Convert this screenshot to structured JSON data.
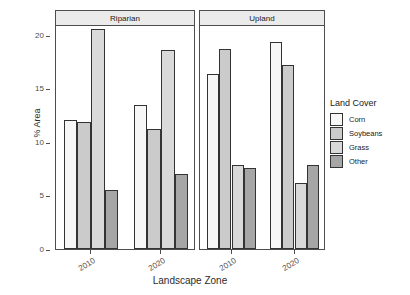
{
  "chart_data": {
    "type": "bar",
    "title": "",
    "xlabel": "Landscape Zone",
    "ylabel": "% Area",
    "ylim": [
      0,
      21
    ],
    "yticks": [
      0,
      5,
      10,
      15,
      20
    ],
    "ytick_labels": [
      "0",
      "5",
      "10",
      "15",
      "20"
    ],
    "grid": false,
    "legend_position": "right",
    "legend_title": "Land Cover",
    "facet_labels": [
      "Riparian",
      "Upland"
    ],
    "categories": [
      "2010",
      "2020"
    ],
    "series": [
      {
        "name": "Corn",
        "color": "#f7f7f7",
        "values": {
          "Riparian": [
            12.0,
            13.4
          ],
          "Upland": [
            16.3,
            19.3
          ]
        }
      },
      {
        "name": "Soybeans",
        "color": "#cbcbcb",
        "values": {
          "Riparian": [
            11.9,
            11.2
          ],
          "Upland": [
            18.7,
            17.2
          ]
        }
      },
      {
        "name": "Grass",
        "color": "#d9d9d9",
        "values": {
          "Riparian": [
            20.5,
            18.6
          ],
          "Upland": [
            7.8,
            6.2
          ]
        }
      },
      {
        "name": "Other",
        "color": "#a6a6a6",
        "values": {
          "Riparian": [
            5.5,
            7.0
          ],
          "Upland": [
            7.6,
            7.8
          ]
        }
      }
    ]
  },
  "axes": {
    "y_title": "% Area",
    "x_title": "Landscape Zone",
    "y_tick_labels": [
      "20",
      "15",
      "10",
      "5",
      "0"
    ],
    "x_tick_labels": [
      "2010",
      "2020"
    ]
  },
  "facets": [
    {
      "label": "Riparian"
    },
    {
      "label": "Upland"
    }
  ],
  "legend": {
    "title": "Land Cover",
    "items": [
      {
        "label": "Corn",
        "color": "#f7f7f7"
      },
      {
        "label": "Soybeans",
        "color": "#cbcbcb"
      },
      {
        "label": "Grass",
        "color": "#d9d9d9"
      },
      {
        "label": "Other",
        "color": "#a6a6a6"
      }
    ]
  }
}
